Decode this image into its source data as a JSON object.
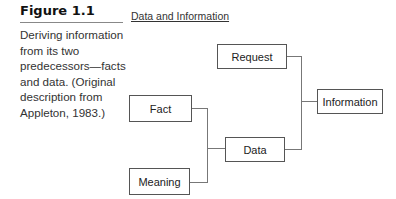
{
  "figure": {
    "label": "Figure 1.1",
    "caption": "Deriving information from its two predecessors—facts and data. (Original description from Appleton, 1983.)"
  },
  "diagram": {
    "title": "Data and Information",
    "nodes": {
      "fact": "Fact",
      "meaning": "Meaning",
      "data": "Data",
      "request": "Request",
      "information": "Information"
    },
    "edges": [
      {
        "from": [
          "Fact",
          "Meaning"
        ],
        "to": "Data"
      },
      {
        "from": [
          "Request",
          "Data"
        ],
        "to": "Information"
      }
    ]
  }
}
